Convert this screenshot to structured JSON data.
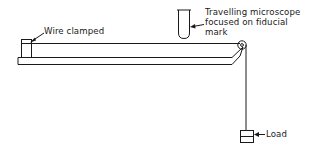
{
  "diagram": {
    "type": "apparatus",
    "labels": {
      "wire_clamped": "Wire clamped",
      "microscope_line1": "Travelling microscope",
      "microscope_line2": "focused on fiducial",
      "microscope_line3": "mark",
      "load": "Load"
    },
    "components": [
      "bench",
      "clamp",
      "wire",
      "travelling-microscope",
      "pulley",
      "load"
    ],
    "colors": {
      "ink": "#1a1a1a",
      "background": "#ffffff"
    }
  }
}
